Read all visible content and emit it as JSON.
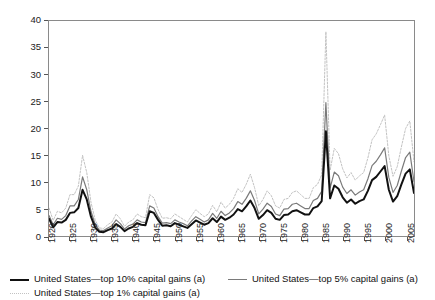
{
  "chart_data": {
    "type": "line",
    "title": "",
    "subtitle": "",
    "xlabel": "",
    "ylabel": "",
    "xlim": [
      1920,
      2007
    ],
    "ylim": [
      0,
      40
    ],
    "grid": false,
    "legend_position": "bottom",
    "x_tick_labels": [
      "1920",
      "1925",
      "1930",
      "1935",
      "1940",
      "1945",
      "1950",
      "1955",
      "1960",
      "1965",
      "1970",
      "1975",
      "1980",
      "1985",
      "1990",
      "1995",
      "2000",
      "2005"
    ],
    "x_tick_values": [
      1920,
      1925,
      1930,
      1935,
      1940,
      1945,
      1950,
      1955,
      1960,
      1965,
      1970,
      1975,
      1980,
      1985,
      1990,
      1995,
      2000,
      2005
    ],
    "y_tick_labels": [
      "0",
      "5",
      "10",
      "15",
      "20",
      "25",
      "30",
      "35",
      "40"
    ],
    "y_tick_values": [
      0,
      5,
      10,
      15,
      20,
      25,
      30,
      35,
      40
    ],
    "x": [
      1920,
      1921,
      1922,
      1923,
      1924,
      1925,
      1926,
      1927,
      1928,
      1929,
      1930,
      1931,
      1932,
      1933,
      1934,
      1935,
      1936,
      1937,
      1938,
      1939,
      1940,
      1941,
      1942,
      1943,
      1944,
      1945,
      1946,
      1947,
      1948,
      1949,
      1950,
      1951,
      1952,
      1953,
      1954,
      1955,
      1956,
      1957,
      1958,
      1959,
      1960,
      1961,
      1962,
      1963,
      1964,
      1965,
      1966,
      1967,
      1968,
      1969,
      1970,
      1971,
      1972,
      1973,
      1974,
      1975,
      1976,
      1977,
      1978,
      1979,
      1980,
      1981,
      1982,
      1983,
      1984,
      1985,
      1986,
      1987,
      1988,
      1989,
      1990,
      1991,
      1992,
      1993,
      1994,
      1995,
      1996,
      1997,
      1998,
      1999,
      2000,
      2001,
      2002,
      2003,
      2004,
      2005,
      2006,
      2007
    ],
    "series": [
      {
        "name": "United States—top 10% capital gains (a)",
        "color": "#111111",
        "width": 2.0,
        "style": "solid",
        "values": [
          3.2,
          1.6,
          2.6,
          2.5,
          3.0,
          4.3,
          4.4,
          5.2,
          8.6,
          6.8,
          3.6,
          1.6,
          0.8,
          0.7,
          1.1,
          1.4,
          2.2,
          1.7,
          0.9,
          1.4,
          1.7,
          2.4,
          2.1,
          2.0,
          4.6,
          4.3,
          3.0,
          1.9,
          2.0,
          1.8,
          2.4,
          2.1,
          1.8,
          1.5,
          2.2,
          2.9,
          2.5,
          2.1,
          2.4,
          3.3,
          2.6,
          3.6,
          3.0,
          3.4,
          4.0,
          5.0,
          4.6,
          5.5,
          6.6,
          5.2,
          3.2,
          3.9,
          4.8,
          4.3,
          3.2,
          3.0,
          3.9,
          4.0,
          4.6,
          4.8,
          4.4,
          4.0,
          4.0,
          5.2,
          5.5,
          6.5,
          19.5,
          7.0,
          9.4,
          8.8,
          7.2,
          6.2,
          6.8,
          6.0,
          6.5,
          6.8,
          8.4,
          10.4,
          11.0,
          12.0,
          13.0,
          8.6,
          6.4,
          7.4,
          9.6,
          11.6,
          12.4,
          8.0
        ]
      },
      {
        "name": "United States—top 5% capital gains (a)",
        "color": "#7a7a7a",
        "width": 1.2,
        "style": "solid",
        "values": [
          3.8,
          2.1,
          3.3,
          3.1,
          3.8,
          5.6,
          5.6,
          6.8,
          11.0,
          8.6,
          4.6,
          2.2,
          1.1,
          1.0,
          1.5,
          1.9,
          3.0,
          2.3,
          1.3,
          1.9,
          2.2,
          3.0,
          2.6,
          2.5,
          5.6,
          5.2,
          3.6,
          2.4,
          2.5,
          2.3,
          3.0,
          2.6,
          2.3,
          1.9,
          2.8,
          3.6,
          3.1,
          2.6,
          3.0,
          4.2,
          3.3,
          4.6,
          3.8,
          4.3,
          5.1,
          6.4,
          5.9,
          7.0,
          8.4,
          6.6,
          4.1,
          5.0,
          6.1,
          5.5,
          4.1,
          3.8,
          5.0,
          5.1,
          5.9,
          6.1,
          5.6,
          5.1,
          5.1,
          6.6,
          7.0,
          8.3,
          24.8,
          8.9,
          11.9,
          11.2,
          9.1,
          7.9,
          8.6,
          7.6,
          8.2,
          8.6,
          10.6,
          13.1,
          13.9,
          15.1,
          16.4,
          10.9,
          8.1,
          9.4,
          12.1,
          14.6,
          15.6,
          10.1
        ]
      },
      {
        "name": "United States—top 1% capital gains (a)",
        "color": "#c2c2c2",
        "width": 1.0,
        "style": "dotted",
        "values": [
          5.2,
          2.9,
          4.6,
          4.3,
          5.2,
          7.7,
          7.7,
          9.3,
          15.0,
          11.8,
          6.3,
          3.0,
          1.5,
          1.4,
          2.1,
          2.6,
          4.1,
          3.2,
          1.8,
          2.6,
          3.0,
          4.1,
          3.6,
          3.4,
          7.7,
          7.1,
          4.9,
          3.3,
          3.4,
          3.2,
          4.1,
          3.6,
          3.1,
          2.6,
          3.8,
          4.9,
          4.2,
          3.6,
          4.1,
          5.7,
          4.5,
          6.3,
          5.2,
          5.9,
          7.0,
          8.8,
          8.1,
          9.6,
          11.5,
          9.0,
          5.6,
          6.8,
          8.4,
          7.5,
          5.6,
          5.2,
          6.8,
          7.0,
          8.1,
          8.4,
          7.7,
          7.0,
          7.0,
          9.0,
          9.6,
          11.4,
          38.0,
          12.2,
          16.3,
          15.3,
          12.5,
          10.8,
          11.8,
          10.4,
          11.2,
          11.8,
          14.5,
          17.9,
          19.0,
          20.7,
          22.5,
          14.9,
          11.1,
          12.9,
          16.6,
          20.0,
          21.4,
          13.8
        ]
      }
    ]
  },
  "legend": {
    "items": [
      {
        "label": "United States—top 10% capital gains (a)"
      },
      {
        "label": "United States—top 5% capital gains (a)"
      },
      {
        "label": "United States—top 1% capital gains (a)"
      }
    ]
  }
}
